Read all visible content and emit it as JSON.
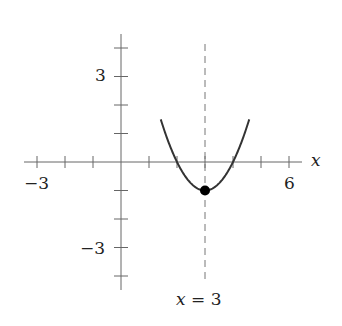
{
  "chart_data": {
    "type": "line",
    "title": "",
    "function": "f(x) = (x - 3)^2 - 1",
    "xlabel": "x",
    "ylabel": "",
    "xlim": [
      -3.4,
      6.5
    ],
    "ylim": [
      -4.5,
      4.5
    ],
    "x_ticks": [
      -3,
      -2,
      -1,
      0,
      1,
      2,
      3,
      4,
      5,
      6
    ],
    "y_ticks": [
      -4,
      -3,
      -2,
      -1,
      1,
      2,
      3,
      4
    ],
    "x_tick_labels": [
      {
        "value": -3,
        "label": "−3"
      },
      {
        "value": 6,
        "label": "6"
      }
    ],
    "y_tick_labels": [
      {
        "value": 3,
        "label": "3"
      },
      {
        "value": -3,
        "label": "−3"
      }
    ],
    "grid": false,
    "series": [
      {
        "name": "parabola",
        "x": [
          1.4,
          1.5,
          2,
          2.5,
          3,
          3.5,
          4,
          4.5,
          4.6
        ],
        "y": [
          1.56,
          1.25,
          0,
          -0.75,
          -1,
          -0.75,
          0,
          1.25,
          1.56
        ]
      }
    ],
    "vertex": {
      "x": 3,
      "y": -1
    },
    "axis_of_symmetry": {
      "x": 3,
      "label": "x = 3",
      "style": "dashed"
    },
    "annotations": [
      "x = 3"
    ]
  },
  "labels": {
    "x_axis": "x",
    "x_neg": "−3",
    "x_pos": "6",
    "y_pos": "3",
    "y_neg": "−3",
    "symmetry_lhs": "x",
    "symmetry_rhs": " = 3"
  }
}
